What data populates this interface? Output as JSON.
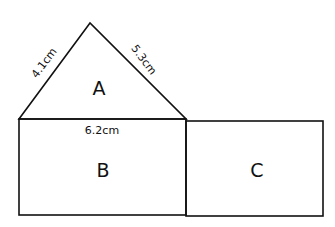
{
  "diagram": {
    "shapes": [
      {
        "id": "A",
        "type": "triangle",
        "label": "A"
      },
      {
        "id": "B",
        "type": "rectangle",
        "label": "B"
      },
      {
        "id": "C",
        "type": "rectangle",
        "label": "C"
      }
    ],
    "dimensions": {
      "triangle_left_side": "4.1cm",
      "triangle_right_side": "5.3cm",
      "base_width": "6.2cm"
    },
    "colors": {
      "stroke": "#111111",
      "background": "#ffffff"
    }
  }
}
